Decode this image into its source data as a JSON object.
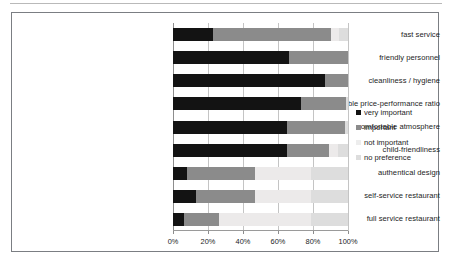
{
  "chart_data": {
    "type": "bar",
    "orientation": "horizontal",
    "stacked": true,
    "stack_mode": "percent",
    "title": "",
    "subtitle": "",
    "xlabel": "",
    "ylabel": "",
    "xlim": [
      0,
      100
    ],
    "xticks": [
      0,
      20,
      40,
      60,
      80,
      100
    ],
    "xtick_labels": [
      "0%",
      "20%",
      "40%",
      "60%",
      "80%",
      "100%"
    ],
    "grid": "vertical",
    "legend_position": "right",
    "categories": [
      "fast service",
      "friendly personnel",
      "cleanliness / hygiene",
      "reasonable price-performance ratio",
      "comfortable atmosphere",
      "child-friendliness",
      "authentical design",
      "self-service restaurant",
      "full service restaurant"
    ],
    "series": [
      {
        "name": "very important",
        "color": "#131313",
        "values": [
          23,
          66,
          87,
          73,
          65,
          65,
          8,
          13,
          6
        ]
      },
      {
        "name": "important",
        "color": "#8b8b8b",
        "values": [
          67,
          34,
          13,
          26,
          33,
          24,
          39,
          34,
          20
        ]
      },
      {
        "name": "not important",
        "color": "#ededed",
        "values": [
          5,
          0,
          0,
          0,
          0,
          5,
          32,
          32,
          53
        ]
      },
      {
        "name": "no preference",
        "color": "#dddddd",
        "values": [
          5,
          0,
          0,
          1,
          2,
          6,
          21,
          21,
          21
        ]
      }
    ]
  },
  "legend": {
    "items": [
      {
        "label": "very important",
        "swatch": "very-important"
      },
      {
        "label": "important",
        "swatch": "important"
      },
      {
        "label": "not important",
        "swatch": "not-important"
      },
      {
        "label": "no preference",
        "swatch": "no-preference"
      }
    ]
  }
}
